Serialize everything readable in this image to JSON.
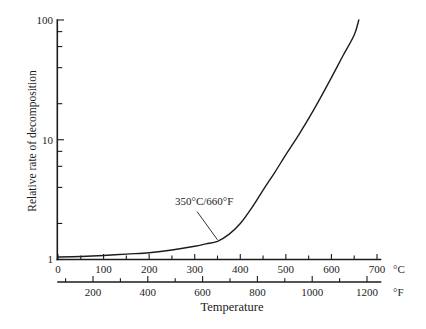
{
  "figure": {
    "background_color": "#ffffff",
    "line_color": "#1c1c1c"
  },
  "chart_data": {
    "type": "line",
    "title": "",
    "xlabel": "Temperature",
    "ylabel": "Relative rate of decomposition",
    "x_unit_primary": "°C",
    "x_unit_secondary": "°F",
    "y_scale": "log",
    "ylim": [
      1,
      100
    ],
    "y_major_ticks": [
      1,
      10,
      100
    ],
    "y_minor_ticks": [
      2,
      4,
      6,
      8,
      20,
      40,
      60,
      80
    ],
    "celsius_axis": {
      "range": [
        0,
        700
      ],
      "labeled_ticks": [
        0,
        100,
        200,
        300,
        400,
        500,
        600,
        700
      ],
      "minor_ticks": [
        50,
        150,
        250,
        350,
        450,
        550,
        650
      ]
    },
    "fahrenheit_axis": {
      "range": [
        100,
        1200
      ],
      "labeled_ticks": [
        200,
        400,
        600,
        800,
        1000,
        1200
      ],
      "minor_ticks": [
        100,
        300,
        500,
        700,
        900,
        1100
      ]
    },
    "annotation": {
      "text": "350°C/660°F",
      "points_to_celsius": 350
    },
    "grid": false,
    "legend": false,
    "series": [
      {
        "name": "Relative decomposition rate",
        "x_celsius": [
          0,
          50,
          100,
          150,
          200,
          250,
          300,
          325,
          350,
          375,
          400,
          425,
          450,
          475,
          500,
          525,
          550,
          575,
          600,
          625,
          650,
          660
        ],
        "y_rate": [
          1.05,
          1.06,
          1.08,
          1.11,
          1.14,
          1.2,
          1.29,
          1.35,
          1.42,
          1.62,
          2.0,
          2.7,
          3.8,
          5.3,
          7.5,
          10.5,
          15.0,
          22.0,
          33.0,
          50.0,
          75.0,
          100.0
        ]
      }
    ]
  }
}
